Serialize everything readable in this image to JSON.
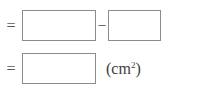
{
  "worksheet": {
    "type": "fill-in-the-blank-equation",
    "rows": [
      {
        "id": "subtraction-step",
        "leading_operator": "=",
        "boxes": [
          {
            "name": "minuend",
            "value": "",
            "placeholder": ""
          },
          {
            "name": "subtrahend",
            "value": "",
            "placeholder": ""
          }
        ],
        "inner_operator": "−",
        "trailing_label": ""
      },
      {
        "id": "result-step",
        "leading_operator": "=",
        "boxes": [
          {
            "name": "result",
            "value": "",
            "placeholder": ""
          }
        ],
        "inner_operator": "",
        "trailing_label": "(cm",
        "trailing_label_superscript": "2",
        "trailing_label_suffix": ")"
      }
    ]
  },
  "operators": {
    "equals": "=",
    "minus": "−"
  },
  "unit": {
    "open_paren": "(cm",
    "exponent": "2",
    "close_paren": ")",
    "full_text": "(cm2)"
  },
  "colors": {
    "background": "#ffffff",
    "box_border": "#8c8c8c",
    "box_fill": "#ffffff",
    "operator_text": "#595959",
    "label_text": "#3d3d3d"
  }
}
